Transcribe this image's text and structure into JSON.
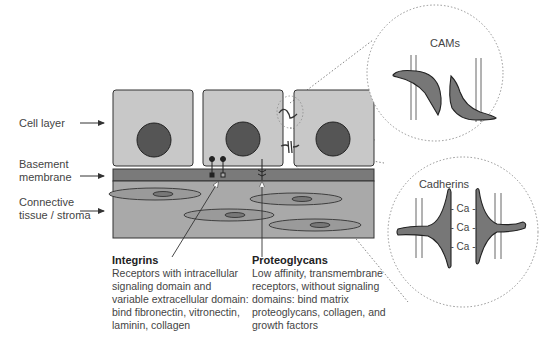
{
  "labels": {
    "cell_layer": "Cell layer",
    "basement_membrane_line1": "Basement",
    "basement_membrane_line2": "membrane",
    "connective_line1": "Connective",
    "connective_line2": "tissue / stroma"
  },
  "insets": {
    "cams": {
      "title": "CAMs"
    },
    "cadherins": {
      "title": "Cadherins",
      "ion_labels": [
        "- Ca -",
        "- Ca -",
        "- Ca -"
      ]
    }
  },
  "captions": {
    "integrins": {
      "title": "Integrins",
      "lines": [
        "Receptors with intracellular",
        "signaling domain and",
        "variable extracellular domain:",
        "bind fibronectin, vitronectin,",
        "laminin, collagen"
      ]
    },
    "proteoglycans": {
      "title": "Proteoglycans",
      "lines": [
        "Low affinity, transmembrane",
        "receptors, without signaling",
        "domains: bind matrix",
        "proteoglycans, collagen, and",
        "growth factors"
      ]
    }
  },
  "colors": {
    "cell_fill": "#c8c8c8",
    "nucleus_fill": "#555555",
    "membrane_fill": "#7a7a7a",
    "stroma_fill": "#a9a9a9",
    "fibroblast_fill": "#9a9a9a",
    "molecule_fill": "#7d7d7d",
    "outline": "#333333"
  }
}
